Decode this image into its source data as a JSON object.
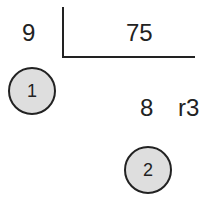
{
  "division": {
    "divisor": "9",
    "dividend": "75",
    "quotient": "8",
    "remainder": "r3"
  },
  "steps": [
    {
      "label": "1"
    },
    {
      "label": "2"
    }
  ],
  "colors": {
    "circle_fill": "#dedede",
    "stroke": "#222222"
  }
}
